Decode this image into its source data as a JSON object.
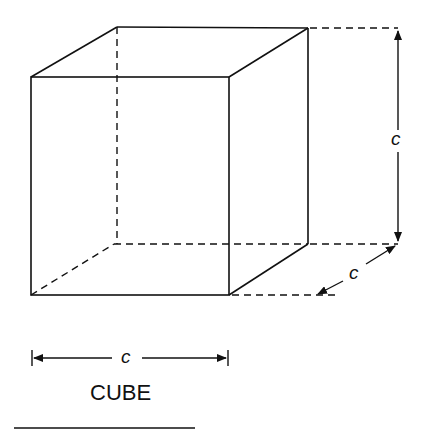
{
  "figure": {
    "title": "CUBE",
    "shape": "cube",
    "dimension_labels": {
      "height": "c",
      "depth": "c",
      "width": "c"
    },
    "colors": {
      "stroke": "#111111",
      "background": "#ffffff"
    }
  }
}
